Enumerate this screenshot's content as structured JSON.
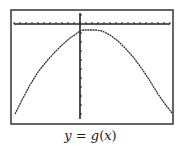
{
  "chart_data": {
    "type": "line",
    "title": "",
    "caption": "y = g(x)",
    "caption_parts": {
      "lhs": "y",
      "eq": " = ",
      "fn": "g",
      "lp": "(",
      "arg": "x",
      "rp": ")"
    },
    "xlabel": "",
    "ylabel": "",
    "grid": false,
    "legend": null,
    "style": "graphing-calculator screen, pixelated dotted curve",
    "series": [
      {
        "name": "g(x)",
        "shape": "downward-opening parabola with flat top near vertex",
        "x": [
          -9,
          -8,
          -7,
          -6,
          -5,
          -4,
          -3,
          -2,
          -1,
          0,
          0.5,
          1,
          1.5,
          2,
          3,
          4,
          5,
          6,
          7,
          8,
          9,
          10,
          11
        ],
        "y": [
          -13.9,
          -11.4,
          -9.1,
          -7.0,
          -5.2,
          -3.7,
          -2.5,
          -1.6,
          -0.9,
          -0.5,
          -0.3,
          -0.3,
          -0.3,
          -0.4,
          -1.0,
          -1.9,
          -3.1,
          -4.6,
          -6.3,
          -8.3,
          -10.5,
          -12.9,
          -13.6
        ]
      }
    ],
    "x_axis": {
      "position_px_y": 24,
      "ticks": 27,
      "tick_spacing_px": 6
    },
    "y_axis": {
      "position_px_x": 80,
      "ticks": 11,
      "tick_spacing_px": 9
    },
    "xlim": [
      -11,
      16
    ],
    "ylim": [
      -15,
      2
    ],
    "frame": {
      "left": 11,
      "top": 10,
      "right": 173,
      "bottom": 124
    },
    "colors": {
      "frame": "#333333",
      "axis": "#222222",
      "curve": "#333333",
      "background": "#ffffff"
    }
  }
}
